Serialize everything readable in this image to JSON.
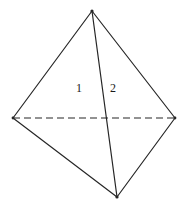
{
  "figure": {
    "kind": "tetrahedron-wireframe",
    "background_color": "#ffffff",
    "stroke_color": "#262626",
    "stroke_width": 1.2,
    "hidden_edge_style": "dashed",
    "hidden_edge_dash_pattern": "7,4",
    "canvas": {
      "width": 186,
      "height": 208
    },
    "vertices": {
      "apex": {
        "name": "apex",
        "x": 92,
        "y": 11
      },
      "left": {
        "name": "left-vertex",
        "x": 13,
        "y": 118
      },
      "right": {
        "name": "right-vertex",
        "x": 175,
        "y": 118
      },
      "bottom": {
        "name": "bottom-vertex",
        "x": 117,
        "y": 197
      }
    },
    "edges": [
      {
        "id": "edge-apex-left",
        "from": "apex",
        "to": "left",
        "style": "solid"
      },
      {
        "id": "edge-apex-right",
        "from": "apex",
        "to": "right",
        "style": "solid"
      },
      {
        "id": "edge-apex-bottom",
        "from": "apex",
        "to": "bottom",
        "style": "solid"
      },
      {
        "id": "edge-left-bottom",
        "from": "left",
        "to": "bottom",
        "style": "solid"
      },
      {
        "id": "edge-right-bottom",
        "from": "right",
        "to": "bottom",
        "style": "solid"
      },
      {
        "id": "edge-left-right",
        "from": "left",
        "to": "right",
        "style": "dashed"
      }
    ],
    "labels": {
      "face_1": "1",
      "face_2": "2"
    }
  }
}
